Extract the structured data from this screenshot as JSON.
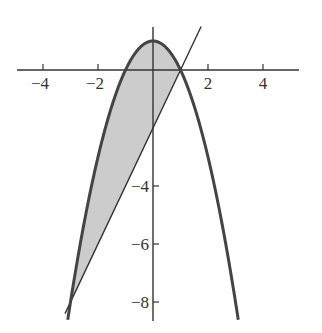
{
  "chart_data": {
    "type": "line",
    "title": "",
    "xlabel": "",
    "ylabel": "",
    "xlim": [
      -5.0,
      5.3
    ],
    "ylim": [
      -8.6,
      1.5
    ],
    "grid": false,
    "x_ticks": [
      -4,
      -2,
      2,
      4
    ],
    "x_tick_labels": [
      "−4",
      "−2",
      "2",
      "4"
    ],
    "y_ticks": [
      -4,
      -6,
      -8
    ],
    "y_tick_labels": [
      "−4",
      "−6",
      "−8"
    ],
    "series": [
      {
        "name": "parabola y = 1 - x^2",
        "role": "upper-curve",
        "x_range": [
          -3.1,
          3.1
        ],
        "points": [
          [
            -3,
            -8
          ],
          [
            -2,
            -3
          ],
          [
            -1,
            0
          ],
          [
            0,
            1
          ],
          [
            1,
            0
          ],
          [
            2,
            -3
          ],
          [
            3,
            -8
          ]
        ]
      },
      {
        "name": "line y = 2x - 2",
        "role": "lower-line",
        "x_range": [
          -3.2,
          1.75
        ],
        "points": [
          [
            -3,
            -8
          ],
          [
            0,
            -2
          ],
          [
            1,
            0
          ],
          [
            1.75,
            1.5
          ]
        ]
      }
    ],
    "shaded_region": {
      "between": [
        "parabola y = 1 - x^2",
        "line y = 2x - 2"
      ],
      "x_from": -3,
      "x_to": 1,
      "fill": "#cccccc"
    },
    "intersections": [
      [
        -3,
        -8
      ],
      [
        1,
        0
      ]
    ],
    "colors": {
      "curve": "#444444",
      "line": "#333333",
      "axis": "#333333",
      "fill": "#cccccc"
    }
  }
}
